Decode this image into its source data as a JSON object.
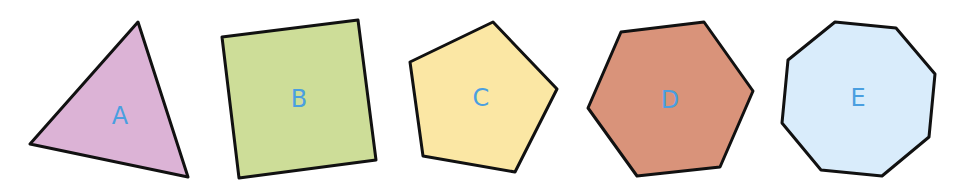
{
  "canvas": {
    "width": 958,
    "height": 185,
    "background": "#ffffff"
  },
  "label_color": "#4a9fe0",
  "shapes": [
    {
      "name": "triangle",
      "label": "A",
      "fill": "#dcb3d6",
      "sides": 3,
      "points": "138,22 188,177 30,144",
      "label_pos": [
        120,
        116
      ]
    },
    {
      "name": "square",
      "label": "B",
      "fill": "#cddd98",
      "sides": 4,
      "points": "222,37 358,20 376,160 239,178",
      "label_pos": [
        299,
        99
      ]
    },
    {
      "name": "pentagon",
      "label": "C",
      "fill": "#fbe7a4",
      "sides": 5,
      "points": "493,22 557,89 515,172 423,156 410,62",
      "label_pos": [
        481,
        98
      ]
    },
    {
      "name": "hexagon",
      "label": "D",
      "fill": "#d9937a",
      "sides": 6,
      "points": "621,32 704,22 753,91 720,167 637,176 588,108",
      "label_pos": [
        670,
        100
      ]
    },
    {
      "name": "octagon",
      "label": "E",
      "fill": "#d9ecfb",
      "sides": 8,
      "points": "835,22 896,28 935,74 929,137 882,176 821,170 782,123 788,60",
      "label_pos": [
        858,
        98
      ]
    }
  ]
}
